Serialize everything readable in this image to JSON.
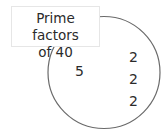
{
  "diagram": {
    "title_line1": "Prime factors",
    "title_line2": "of 40",
    "circle": {
      "cx": 104,
      "cy": 72.5,
      "r": 56,
      "stroke": "#6a6a6a"
    },
    "factors": [
      {
        "value": "5",
        "x": 75,
        "y": 63
      },
      {
        "value": "2",
        "x": 129,
        "y": 49
      },
      {
        "value": "2",
        "x": 129,
        "y": 71
      },
      {
        "value": "2",
        "x": 129,
        "y": 93
      }
    ]
  }
}
